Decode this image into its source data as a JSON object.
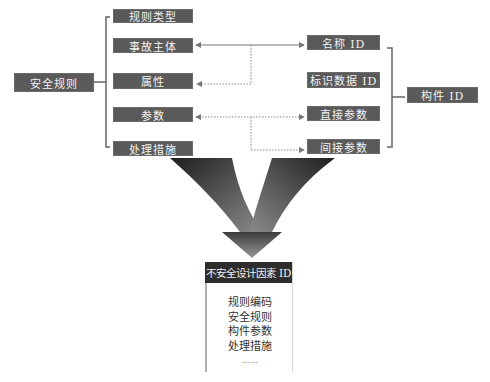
{
  "root": {
    "label": "安全规则"
  },
  "left_items": [
    {
      "label": "规则类型"
    },
    {
      "label": "事故主体"
    },
    {
      "label": "属性"
    },
    {
      "label": "参数"
    },
    {
      "label": "处理措施"
    }
  ],
  "right_items": [
    {
      "label": "名称 ID"
    },
    {
      "label": "标识数据 ID"
    },
    {
      "label": "直接参数"
    },
    {
      "label": "间接参数"
    }
  ],
  "component": {
    "label": "构件 ID"
  },
  "result": {
    "title": "不安全设计因素 ID",
    "lines": [
      "规则编码",
      "安全规则",
      "构件参数",
      "处理措施",
      "……"
    ]
  },
  "colors": {
    "box": "#5a5a5a",
    "header": "#2e2e2e",
    "line": "#777777"
  }
}
